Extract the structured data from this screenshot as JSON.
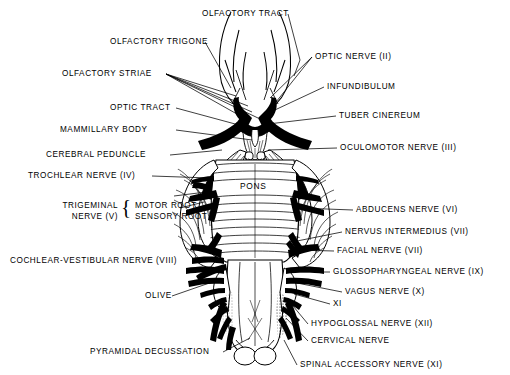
{
  "figure": {
    "kind": "anatomical-diagram",
    "ink_color": "#000000",
    "background_color": "#ffffff",
    "inline_structure_labels": [
      {
        "name": "pons-label",
        "text": "PONS",
        "x": 248,
        "y": 186
      }
    ],
    "labels_left": [
      {
        "name": "label-olfactory-trigone",
        "text": "OLFACTORY TRIGONE",
        "x": 110,
        "y": 42,
        "leader_to": [
          231,
          88
        ]
      },
      {
        "name": "label-olfactory-striae",
        "text": "OLFACTORY STRIAE",
        "x": 62,
        "y": 74,
        "leader_to": [
          248,
          108
        ]
      },
      {
        "name": "label-optic-tract",
        "text": "OPTIC TRACT",
        "x": 110,
        "y": 108,
        "leader_to": [
          250,
          128
        ]
      },
      {
        "name": "label-mammillary-body",
        "text": "MAMMILLARY BODY",
        "x": 60,
        "y": 130,
        "leader_to": [
          255,
          138
        ]
      },
      {
        "name": "label-cerebral-peduncle",
        "text": "CEREBRAL PEDUNCLE",
        "x": 46,
        "y": 155,
        "leader_to": [
          224,
          150
        ]
      },
      {
        "name": "label-trochlear-nerve",
        "text": "TROCHLEAR NERVE (IV)",
        "x": 28,
        "y": 176,
        "leader_to": [
          212,
          178
        ]
      },
      {
        "name": "label-cochlear-vestibular-nerve",
        "text": "COCHLEAR-VESTIBULAR NERVE (VIII)",
        "x": 10,
        "y": 261,
        "leader_to": [
          214,
          258
        ]
      },
      {
        "name": "label-olive",
        "text": "OLIVE",
        "x": 145,
        "y": 296,
        "leader_to": [
          216,
          281
        ]
      },
      {
        "name": "label-pyramidal-decussation",
        "text": "PYRAMIDAL DECUSSATION",
        "x": 90,
        "y": 352,
        "leader_to": [
          248,
          338
        ]
      }
    ],
    "labels_trigeminal_group": {
      "name": "trigeminal-group",
      "line1": "TRIGEMINAL",
      "line2": "NERVE (V)",
      "brace": "{",
      "sub1": {
        "name": "label-motor-root",
        "text": "MOTOR ROOT",
        "leader_to": [
          205,
          196
        ]
      },
      "sub2": {
        "name": "label-sensory-root",
        "text": "SENSORY ROOT",
        "leader_to": [
          203,
          208
        ]
      },
      "x": 18,
      "y": 205
    },
    "labels_right": [
      {
        "name": "label-olfactory-tract",
        "text": "OLFACTORY TRACT",
        "x": 202,
        "y": 14,
        "leader_to": [
          292,
          74
        ]
      },
      {
        "name": "label-optic-nerve",
        "text": "OPTIC NERVE (II)",
        "x": 315,
        "y": 57,
        "leader_to": [
          272,
          104
        ]
      },
      {
        "name": "label-infundibulum",
        "text": "INFUNDIBULUM",
        "x": 327,
        "y": 87,
        "leader_to": [
          268,
          114
        ]
      },
      {
        "name": "label-tuber-cinereum",
        "text": "TUBER CINEREUM",
        "x": 339,
        "y": 116,
        "leader_to": [
          272,
          122
        ]
      },
      {
        "name": "label-oculomotor-nerve",
        "text": "OCULOMOTOR NERVE (III)",
        "x": 340,
        "y": 148,
        "leader_to": [
          268,
          150
        ]
      },
      {
        "name": "label-abducens-nerve",
        "text": "ABDUCENS NERVE (VI)",
        "x": 356,
        "y": 210,
        "leader_to": [
          296,
          206
        ]
      },
      {
        "name": "label-nervus-intermedius",
        "text": "NERVUS INTERMEDIUS (VII)",
        "x": 345,
        "y": 232,
        "leader_to": [
          290,
          240
        ]
      },
      {
        "name": "label-facial-nerve",
        "text": "FACIAL NERVE (VII)",
        "x": 337,
        "y": 251,
        "leader_to": [
          292,
          248
        ]
      },
      {
        "name": "label-glossopharyngeal-nerve",
        "text": "GLOSSOPHARYNGEAL NERVE (IX)",
        "x": 333,
        "y": 272,
        "leader_to": [
          291,
          272
        ]
      },
      {
        "name": "label-vagus-nerve",
        "text": "VAGUS NERVE (X)",
        "x": 345,
        "y": 292,
        "leader_to": [
          291,
          284
        ]
      },
      {
        "name": "label-xi-short",
        "text": "XI",
        "x": 333,
        "y": 304,
        "leader_to": [
          293,
          294
        ]
      },
      {
        "name": "label-hypoglossal-nerve",
        "text": "HYPOGLOSSAL NERVE (XII)",
        "x": 311,
        "y": 324,
        "leader_to": [
          288,
          302
        ]
      },
      {
        "name": "label-cervical-nerve",
        "text": "CERVICAL NERVE",
        "x": 311,
        "y": 341,
        "leader_to": [
          285,
          320
        ]
      },
      {
        "name": "label-spinal-accessory-nerve",
        "text": "SPINAL  ACCESSORY  NERVE (XI)",
        "x": 300,
        "y": 365,
        "leader_to": [
          283,
          340
        ]
      }
    ]
  }
}
